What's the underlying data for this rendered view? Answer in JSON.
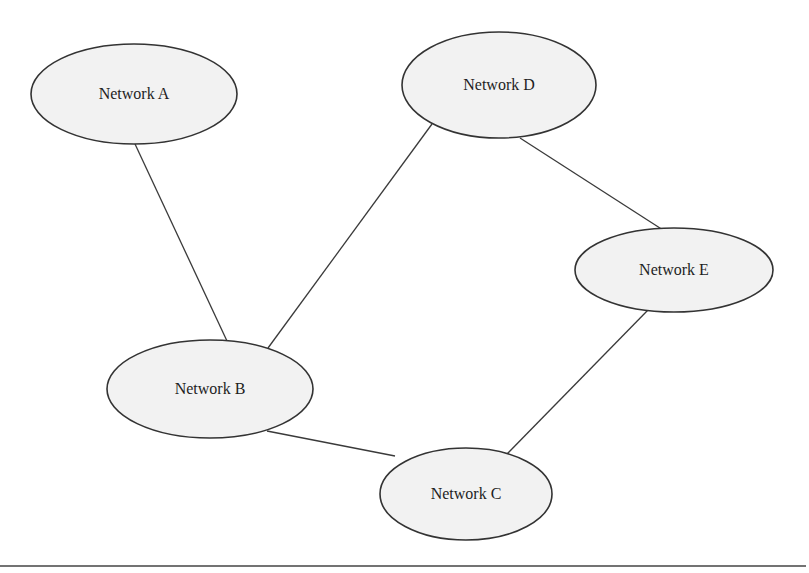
{
  "diagram": {
    "type": "network-topology",
    "nodes": [
      {
        "id": "A",
        "label": "Network A",
        "cx": 134,
        "cy": 94,
        "rx": 103,
        "ry": 50
      },
      {
        "id": "D",
        "label": "Network D",
        "cx": 499,
        "cy": 85,
        "rx": 97,
        "ry": 53
      },
      {
        "id": "E",
        "label": "Network E",
        "cx": 674,
        "cy": 270,
        "rx": 99,
        "ry": 42
      },
      {
        "id": "B",
        "label": "Network B",
        "cx": 210,
        "cy": 389,
        "rx": 103,
        "ry": 49
      },
      {
        "id": "C",
        "label": "Network C",
        "cx": 466,
        "cy": 494,
        "rx": 86,
        "ry": 46
      }
    ],
    "edges": [
      {
        "from": "A",
        "to": "B",
        "x1": 135,
        "y1": 144,
        "x2": 227,
        "y2": 341
      },
      {
        "from": "D",
        "to": "B",
        "x1": 432,
        "y1": 124,
        "x2": 268,
        "y2": 348
      },
      {
        "from": "D",
        "to": "E",
        "x1": 520,
        "y1": 138,
        "x2": 663,
        "y2": 230
      },
      {
        "from": "E",
        "to": "C",
        "x1": 648,
        "y1": 310,
        "x2": 506,
        "y2": 455
      },
      {
        "from": "B",
        "to": "C",
        "x1": 267,
        "y1": 431,
        "x2": 395,
        "y2": 456
      }
    ],
    "colors": {
      "node_fill": "#f2f2f2",
      "node_stroke": "#333333",
      "edge": "#3a3a3a",
      "text": "#1e1e1e",
      "background": "#ffffff"
    }
  },
  "rule": {
    "x1": 0,
    "y1": 566,
    "x2": 806,
    "y2": 566
  }
}
